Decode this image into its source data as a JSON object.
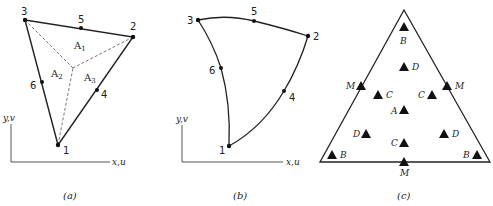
{
  "figure": {
    "panels": [
      {
        "id": "a",
        "caption": "(a)",
        "description": "Straight-sided six-node triangle with area coordinates",
        "nodes": [
          {
            "label": "1",
            "x": 58,
            "y": 145
          },
          {
            "label": "2",
            "x": 133,
            "y": 37
          },
          {
            "label": "3",
            "x": 25,
            "y": 20
          },
          {
            "label": "4",
            "x": 97,
            "y": 90
          },
          {
            "label": "5",
            "x": 81,
            "y": 28
          },
          {
            "label": "6",
            "x": 42,
            "y": 82
          }
        ],
        "interior_point": {
          "x": 73,
          "y": 68
        },
        "areas": [
          {
            "label": "A",
            "sub": "1"
          },
          {
            "label": "A",
            "sub": "2"
          },
          {
            "label": "A",
            "sub": "3"
          }
        ],
        "axis_y_label": "y,v",
        "axis_x_label": "x,u"
      },
      {
        "id": "b",
        "caption": "(b)",
        "description": "Curved-sided six-node isoparametric triangle",
        "nodes": [
          {
            "label": "1",
            "x": 229,
            "y": 146
          },
          {
            "label": "2",
            "x": 308,
            "y": 36
          },
          {
            "label": "3",
            "x": 198,
            "y": 20
          },
          {
            "label": "4",
            "x": 284,
            "y": 91
          },
          {
            "label": "5",
            "x": 254,
            "y": 21
          },
          {
            "label": "6",
            "x": 221,
            "y": 68
          }
        ],
        "axis_y_label": "y,v",
        "axis_x_label": "x,u"
      },
      {
        "id": "c",
        "caption": "(c)",
        "description": "Triangle with integration point families",
        "points": [
          {
            "label": "B",
            "x": 404,
            "y": 27
          },
          {
            "label": "D",
            "x": 404,
            "y": 67
          },
          {
            "label": "M",
            "x": 361,
            "y": 86
          },
          {
            "label": "C",
            "x": 378,
            "y": 95
          },
          {
            "label": "C",
            "x": 432,
            "y": 95
          },
          {
            "label": "M",
            "x": 447,
            "y": 86
          },
          {
            "label": "A",
            "x": 404,
            "y": 110
          },
          {
            "label": "D",
            "x": 366,
            "y": 134
          },
          {
            "label": "C",
            "x": 404,
            "y": 143
          },
          {
            "label": "D",
            "x": 444,
            "y": 134
          },
          {
            "label": "B",
            "x": 332,
            "y": 155
          },
          {
            "label": "B",
            "x": 477,
            "y": 155
          },
          {
            "label": "M",
            "x": 404,
            "y": 162
          }
        ]
      }
    ]
  }
}
